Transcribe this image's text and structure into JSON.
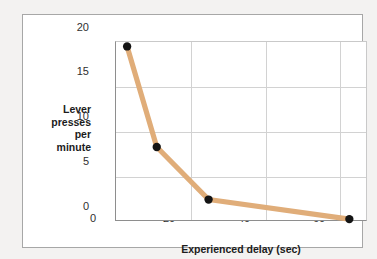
{
  "chart_data": {
    "type": "line",
    "title": "",
    "xlabel": "Experienced delay (sec)",
    "ylabel": "Lever presses per minute",
    "ylabel_lines": [
      "Lever",
      "presses",
      "per",
      "minute"
    ],
    "x": [
      3,
      11,
      25,
      63
    ],
    "values": [
      19.5,
      8.2,
      2.3,
      0.1
    ],
    "series": [
      {
        "name": "Lever presses per minute",
        "x": [
          3,
          11,
          25,
          63
        ],
        "values": [
          19.5,
          8.2,
          2.3,
          0.1
        ]
      }
    ],
    "xlim": [
      0,
      67.5
    ],
    "ylim": [
      0,
      20
    ],
    "xticks": [
      0,
      20,
      40,
      60
    ],
    "xtick_labels": [
      "0",
      "20",
      "40",
      "60"
    ],
    "yticks": [
      0,
      5,
      10,
      15,
      20
    ],
    "ytick_labels": [
      "0",
      "5",
      "10",
      "15",
      "20"
    ],
    "grid": true,
    "legend": false,
    "line_color": "#e0ad79",
    "marker_color": "#141414",
    "marker": "circle",
    "background_color": "#ffffff",
    "frame_color": "#a7a7a7",
    "gridline_color": "#d2d2d2"
  }
}
